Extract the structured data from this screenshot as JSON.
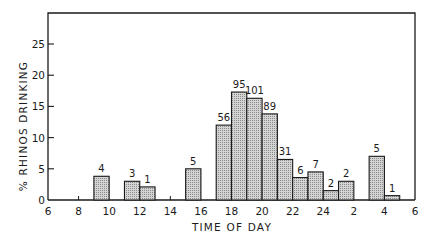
{
  "chart_data": {
    "type": "bar",
    "title": "",
    "xlabel": "TIME OF DAY",
    "ylabel": "% RHINOS DRINKING",
    "ylim": [
      0,
      30
    ],
    "yticks": [
      0,
      5,
      10,
      15,
      20,
      25
    ],
    "xtick_labels": [
      "6",
      "8",
      "10",
      "12",
      "14",
      "16",
      "18",
      "20",
      "22",
      "24",
      "2",
      "4",
      "6"
    ],
    "grid": false,
    "legend": null,
    "bar_width_hours": 1,
    "bars": [
      {
        "start_hour": 9,
        "label": "9-10",
        "value": 3.8,
        "annotation": "4"
      },
      {
        "start_hour": 11,
        "label": "11-12",
        "value": 3.0,
        "annotation": "3"
      },
      {
        "start_hour": 12,
        "label": "12-13",
        "value": 2.1,
        "annotation": "1"
      },
      {
        "start_hour": 15,
        "label": "15-16",
        "value": 5.0,
        "annotation": "5"
      },
      {
        "start_hour": 17,
        "label": "17-18",
        "value": 12.0,
        "annotation": "56"
      },
      {
        "start_hour": 18,
        "label": "18-19",
        "value": 17.3,
        "annotation": "95"
      },
      {
        "start_hour": 19,
        "label": "19-20",
        "value": 16.3,
        "annotation": "101"
      },
      {
        "start_hour": 20,
        "label": "20-21",
        "value": 13.8,
        "annotation": "89"
      },
      {
        "start_hour": 21,
        "label": "21-22",
        "value": 6.5,
        "annotation": "31"
      },
      {
        "start_hour": 22,
        "label": "22-23",
        "value": 3.6,
        "annotation": "6"
      },
      {
        "start_hour": 23,
        "label": "23-24",
        "value": 4.5,
        "annotation": "7"
      },
      {
        "start_hour": 24,
        "label": "24-1",
        "value": 1.5,
        "annotation": "2"
      },
      {
        "start_hour": 25,
        "label": "1-2",
        "value": 3.0,
        "annotation": "2"
      },
      {
        "start_hour": 27,
        "label": "3-4",
        "value": 7.0,
        "annotation": "5"
      },
      {
        "start_hour": 28,
        "label": "4-5",
        "value": 0.7,
        "annotation": "1"
      }
    ],
    "minor_ticks_hours": [
      8,
      14
    ],
    "colors": {
      "bar_fill": "#c4c4c4",
      "bar_stroke": "#1a1a1a",
      "axis": "#1a1a1a"
    }
  }
}
